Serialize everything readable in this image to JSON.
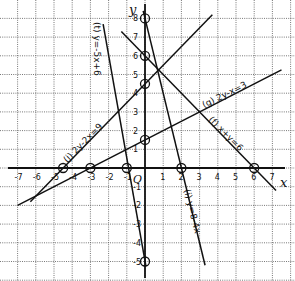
{
  "chart_data": {
    "type": "line",
    "title": "",
    "xlabel": "x",
    "ylabel": "y",
    "origin_label": "O",
    "xlim": [
      -7.5,
      7.8
    ],
    "ylim": [
      -5.3,
      8.8
    ],
    "grid": true,
    "x_ticks": [
      -7,
      -6,
      -5,
      -4,
      -3,
      -2,
      -1,
      1,
      2,
      3,
      4,
      5,
      6,
      7
    ],
    "y_ticks": [
      -5,
      -4,
      -3,
      -2,
      -1,
      1,
      2,
      3,
      4,
      5,
      6,
      7,
      8
    ],
    "series": [
      {
        "name": "(f) x+y=6",
        "equation": "x + y = 6",
        "points": [
          [
            0,
            6
          ],
          [
            6,
            0
          ]
        ],
        "segment": [
          [
            -1.3,
            7.3
          ],
          [
            7.2,
            -1.2
          ]
        ]
      },
      {
        "name": "(g) 2y-x=3",
        "equation": "2y - x = 3",
        "points": [
          [
            -3,
            0
          ],
          [
            0,
            1.5
          ]
        ],
        "segment": [
          [
            -7,
            -2
          ],
          [
            7.5,
            5.25
          ]
        ]
      },
      {
        "name": "(i) y=8-4x",
        "equation": "y = 8 - 4x",
        "points": [
          [
            0,
            8
          ],
          [
            2,
            0
          ]
        ],
        "segment": [
          [
            -0.1,
            8.4
          ],
          [
            3.3,
            -5.2
          ]
        ]
      },
      {
        "name": "(j) 2y-2x=9",
        "equation": "2y - 2x = 9",
        "points": [
          [
            -4.5,
            0
          ],
          [
            0,
            4.5
          ]
        ],
        "segment": [
          [
            -6.3,
            -1.8
          ],
          [
            3.7,
            8.2
          ]
        ]
      },
      {
        "name": "(t) y=-5x+6",
        "equation": "y = -5x - 5",
        "points": [
          [
            -1,
            0
          ],
          [
            0,
            -5
          ]
        ],
        "segment": [
          [
            -2.3,
            7.7
          ],
          [
            0.05,
            -5.25
          ]
        ]
      }
    ]
  },
  "labels": {
    "x_axis": "x",
    "y_axis": "y",
    "origin": "O",
    "eq_f": "(f) x+y=6",
    "eq_g": "(g) 2y-x=3",
    "eq_i": "(i) y=8-4x",
    "eq_j": "(j) 2y-2x=9",
    "eq_t": "(t) y=-5x+6"
  },
  "x_tick_labels": [
    "-7",
    "-6",
    "-5",
    "-4",
    "-3",
    "-2",
    "-1",
    "1",
    "2",
    "3",
    "4",
    "5",
    "6",
    "7"
  ],
  "y_tick_labels": [
    "8",
    "7",
    "6",
    "5",
    "4",
    "3",
    "2",
    "1",
    "-1",
    "-2",
    "-3",
    "-4",
    "-5"
  ]
}
